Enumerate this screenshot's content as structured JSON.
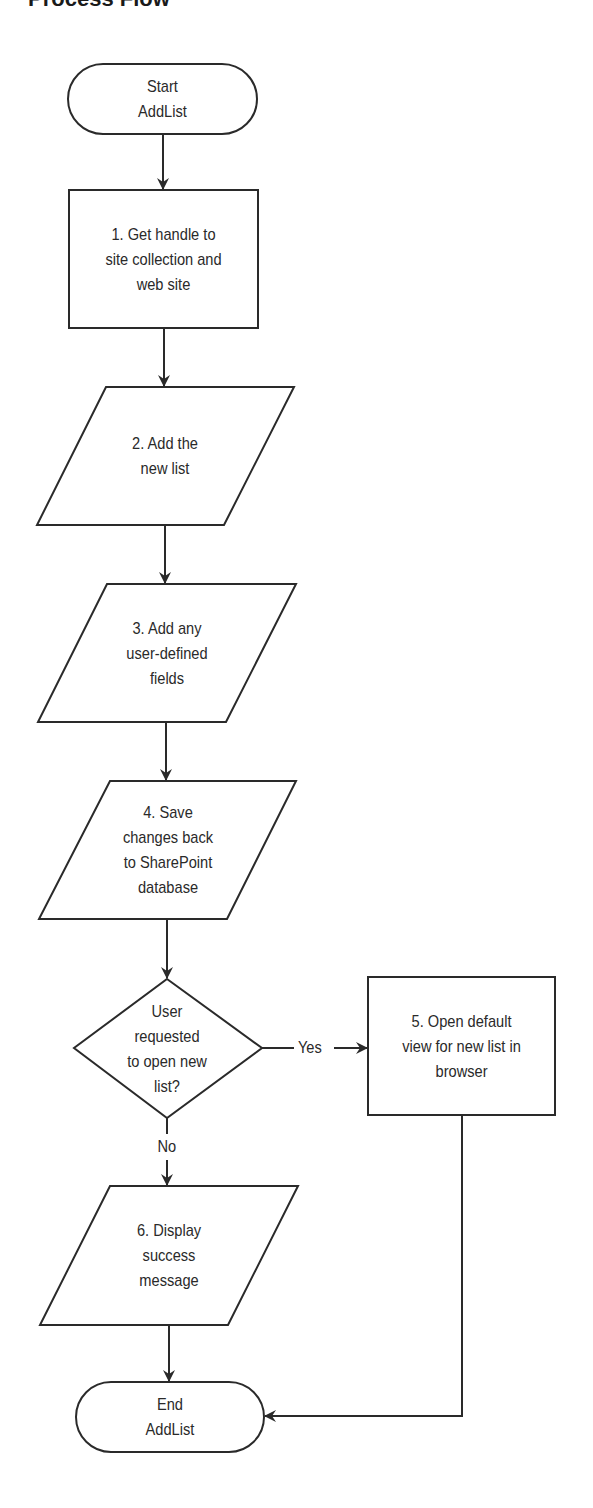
{
  "page": {
    "title": "Process Flow"
  },
  "colors": {
    "stroke": "#2a2a2a",
    "background": "#ffffff",
    "text": "#2a2a2a"
  },
  "nodes": {
    "start": {
      "shape": "terminal",
      "lines": [
        "Start",
        "AddList"
      ]
    },
    "step1": {
      "shape": "process",
      "lines": [
        "1. Get handle to",
        "site collection and",
        "web site"
      ]
    },
    "step2": {
      "shape": "data",
      "lines": [
        "2. Add the",
        "new list"
      ]
    },
    "step3": {
      "shape": "data",
      "lines": [
        "3. Add any",
        "user-defined",
        "fields"
      ]
    },
    "step4": {
      "shape": "data",
      "lines": [
        "4. Save",
        "changes back",
        "to SharePoint",
        "database"
      ]
    },
    "decision": {
      "shape": "decision",
      "lines": [
        "User",
        "requested",
        "to open new",
        "list?"
      ]
    },
    "step5": {
      "shape": "process",
      "lines": [
        "5. Open default",
        "view for new list in",
        "browser"
      ]
    },
    "step6": {
      "shape": "data",
      "lines": [
        "6. Display",
        "success",
        "message"
      ]
    },
    "end": {
      "shape": "terminal",
      "lines": [
        "End",
        "AddList"
      ]
    }
  },
  "edges": {
    "yes_label": "Yes",
    "no_label": "No"
  }
}
